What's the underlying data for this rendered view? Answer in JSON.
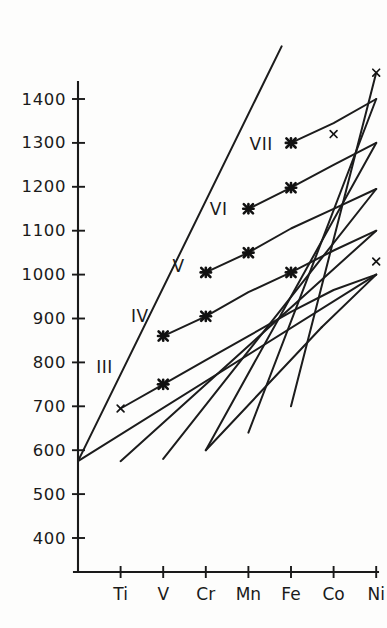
{
  "chart_data": {
    "type": "line",
    "title": "",
    "subtitle": "",
    "xlabel": "",
    "ylabel": "",
    "grid": false,
    "legend_position": "inline-labels",
    "categories": [
      "Ti",
      "V",
      "Cr",
      "Mn",
      "Fe",
      "Co",
      "Ni"
    ],
    "x_tick_labels": [
      "Ti",
      "V",
      "Cr",
      "Mn",
      "Fe",
      "Co",
      "Ni"
    ],
    "y_tick_labels": [
      "400",
      "500",
      "600",
      "700",
      "800",
      "900",
      "1000",
      "1100",
      "1200",
      "1300",
      "1400"
    ],
    "y_tick_values": [
      400,
      500,
      600,
      700,
      800,
      900,
      1000,
      1100,
      1200,
      1300,
      1400
    ],
    "ylim": [
      340,
      1520
    ],
    "xlim": [
      0,
      8
    ],
    "origin_point": {
      "x_index": 0,
      "value": 575,
      "label": ""
    },
    "series": [
      {
        "name": "III",
        "label": "III",
        "label_at": {
          "x_index": 0.62,
          "value": 790
        },
        "points": [
          {
            "category": "Ti",
            "value": 695,
            "marker": "x"
          },
          {
            "category": "V",
            "value": 750,
            "marker": "star"
          },
          {
            "category": "Cr",
            "value": 805,
            "marker": "none"
          },
          {
            "category": "Mn",
            "value": 860,
            "marker": "none"
          },
          {
            "category": "Fe",
            "value": 915,
            "marker": "none"
          },
          {
            "category": "Co",
            "value": 965,
            "marker": "none"
          },
          {
            "category": "Ni",
            "value": 1000,
            "marker": "none"
          }
        ]
      },
      {
        "name": "IV",
        "label": "IV",
        "label_at": {
          "x_index": 1.45,
          "value": 905
        },
        "points": [
          {
            "category": "V",
            "value": 860,
            "marker": "star"
          },
          {
            "category": "Cr",
            "value": 905,
            "marker": "star"
          },
          {
            "category": "Mn",
            "value": 960,
            "marker": "none"
          },
          {
            "category": "Fe",
            "value": 1005,
            "marker": "star"
          },
          {
            "category": "Co",
            "value": 1055,
            "marker": "none"
          },
          {
            "category": "Ni",
            "value": 1100,
            "marker": "none"
          }
        ]
      },
      {
        "name": "V",
        "label": "V",
        "label_at": {
          "x_index": 2.36,
          "value": 1020
        },
        "points": [
          {
            "category": "Cr",
            "value": 1005,
            "marker": "star"
          },
          {
            "category": "Mn",
            "value": 1050,
            "marker": "star"
          },
          {
            "category": "Fe",
            "value": 1105,
            "marker": "none"
          },
          {
            "category": "Co",
            "value": 1150,
            "marker": "none"
          },
          {
            "category": "Ni",
            "value": 1195,
            "marker": "none"
          }
        ]
      },
      {
        "name": "VI",
        "label": "VI",
        "label_at": {
          "x_index": 3.3,
          "value": 1150
        },
        "points": [
          {
            "category": "Mn",
            "value": 1150,
            "marker": "star"
          },
          {
            "category": "Fe",
            "value": 1198,
            "marker": "star"
          },
          {
            "category": "Co",
            "value": 1250,
            "marker": "none"
          },
          {
            "category": "Ni",
            "value": 1300,
            "marker": "none"
          }
        ]
      },
      {
        "name": "VII",
        "label": "VII",
        "label_at": {
          "x_index": 4.3,
          "value": 1298
        },
        "points": [
          {
            "category": "Fe",
            "value": 1300,
            "marker": "star"
          },
          {
            "category": "Co",
            "value": 1345,
            "marker": "none"
          },
          {
            "category": "Ni",
            "value": 1400,
            "marker": "none"
          }
        ]
      }
    ],
    "loose_points": [
      {
        "category": "Co",
        "value": 1320,
        "marker": "x"
      },
      {
        "category": "Ni",
        "value": 1460,
        "marker": "x"
      },
      {
        "category": "Ni",
        "value": 1030,
        "marker": "x"
      }
    ],
    "envelope_lines": [
      {
        "from": {
          "x_index": 0,
          "value": 575
        },
        "to": {
          "x_index": 4.78,
          "value": 1520
        }
      },
      {
        "from": {
          "x_index": 0,
          "value": 575
        },
        "to": {
          "x_index": 7,
          "value": 1000
        }
      },
      {
        "from": {
          "x_index": 1.0,
          "value": 575
        },
        "to": {
          "x_index": 7,
          "value": 1100
        }
      },
      {
        "from": {
          "x_index": 2.0,
          "value": 580
        },
        "to": {
          "x_index": 7,
          "value": 1195
        }
      },
      {
        "from": {
          "x_index": 3.0,
          "value": 600
        },
        "to": {
          "x_index": 7,
          "value": 1300
        }
      },
      {
        "from": {
          "x_index": 4.0,
          "value": 640
        },
        "to": {
          "x_index": 7,
          "value": 1400
        }
      },
      {
        "from": {
          "x_index": 5.0,
          "value": 700
        },
        "to": {
          "x_index": 7,
          "value": 1460
        }
      }
    ],
    "closing_segments": [
      {
        "from": {
          "category": "Ni",
          "value": 1000
        },
        "to": {
          "x_index": 5.72,
          "value": 880
        }
      },
      {
        "from": {
          "x_index": 5.72,
          "value": 880
        },
        "to": {
          "x_index": 3.0,
          "value": 600
        }
      }
    ],
    "marker_note": "bold star = calculated lattice node, thin x = separate measured point"
  },
  "axes": {
    "y_axis_name": "value-axis",
    "x_axis_name": "element-axis"
  }
}
